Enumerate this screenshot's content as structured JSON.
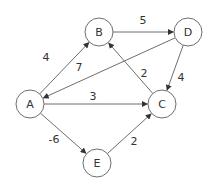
{
  "graph": {
    "type": "directed-weighted",
    "nodes": [
      {
        "id": "A",
        "label": "A",
        "x": 30,
        "y": 104
      },
      {
        "id": "B",
        "label": "B",
        "x": 99,
        "y": 32
      },
      {
        "id": "C",
        "label": "C",
        "x": 162,
        "y": 104
      },
      {
        "id": "D",
        "label": "D",
        "x": 188,
        "y": 32
      },
      {
        "id": "E",
        "label": "E",
        "x": 97,
        "y": 163
      }
    ],
    "edges": [
      {
        "from": "A",
        "to": "B",
        "weight": "4",
        "lx": 46,
        "ly": 57
      },
      {
        "from": "B",
        "to": "D",
        "weight": "5",
        "lx": 143,
        "ly": 20
      },
      {
        "from": "D",
        "to": "A",
        "weight": "7",
        "lx": 79,
        "ly": 67
      },
      {
        "from": "C",
        "to": "B",
        "weight": "2",
        "lx": 144,
        "ly": 73
      },
      {
        "from": "D",
        "to": "C",
        "weight": "4",
        "lx": 181,
        "ly": 77
      },
      {
        "from": "A",
        "to": "C",
        "weight": "3",
        "lx": 93,
        "ly": 96
      },
      {
        "from": "A",
        "to": "E",
        "weight": "-6",
        "lx": 54,
        "ly": 139
      },
      {
        "from": "E",
        "to": "C",
        "weight": "2",
        "lx": 134,
        "ly": 141
      }
    ]
  },
  "style": {
    "node_radius": 14,
    "stroke_color": "#6e6e6e",
    "text_color": "#333333",
    "background": "#ffffff"
  }
}
